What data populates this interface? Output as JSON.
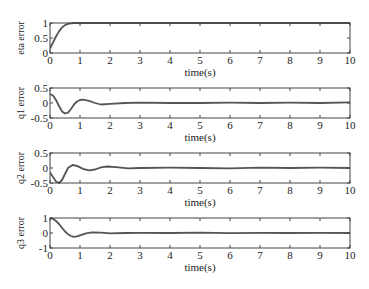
{
  "figure": {
    "width": 369,
    "height": 289
  },
  "style": {
    "line_color": "#555555",
    "axes_color": "#444444",
    "background": "#ffffff"
  },
  "chart_data": [
    {
      "type": "line",
      "title": "",
      "xlabel": "time(s)",
      "ylabel": "eta error",
      "xlim": [
        0,
        10
      ],
      "ylim": [
        0,
        1
      ],
      "xticks": [
        0,
        1,
        2,
        3,
        4,
        5,
        6,
        7,
        8,
        9,
        10
      ],
      "yticks": [
        0,
        0.5,
        1
      ],
      "ytick_labels": [
        "0",
        "0.5",
        "1"
      ],
      "grid": false,
      "box": {
        "left": 50,
        "top": 23,
        "right": 350,
        "bottom": 53
      },
      "series": [
        {
          "name": "eta error",
          "x": [
            0,
            0.1,
            0.2,
            0.3,
            0.4,
            0.5,
            0.6,
            0.7,
            0.8,
            1.0,
            2,
            4,
            6,
            8,
            10
          ],
          "y": [
            0.15,
            0.35,
            0.55,
            0.72,
            0.85,
            0.93,
            0.97,
            0.99,
            1.0,
            1.0,
            1.0,
            1.0,
            1.0,
            1.0,
            1.0
          ]
        }
      ]
    },
    {
      "type": "line",
      "title": "",
      "xlabel": "time(s)",
      "ylabel": "q1 error",
      "xlim": [
        0,
        10
      ],
      "ylim": [
        -0.5,
        0.5
      ],
      "xticks": [
        0,
        1,
        2,
        3,
        4,
        5,
        6,
        7,
        8,
        9,
        10
      ],
      "yticks": [
        -0.5,
        0,
        0.5
      ],
      "ytick_labels": [
        "-0.5",
        "0",
        "0.5"
      ],
      "grid": false,
      "box": {
        "left": 50,
        "top": 88,
        "right": 350,
        "bottom": 118
      },
      "series": [
        {
          "name": "q1 error",
          "x": [
            0,
            0.1,
            0.2,
            0.3,
            0.4,
            0.5,
            0.6,
            0.7,
            0.8,
            0.9,
            1.0,
            1.1,
            1.3,
            1.5,
            1.7,
            2.0,
            2.5,
            3,
            4,
            5,
            6,
            7,
            8,
            9,
            10
          ],
          "y": [
            0.3,
            0.25,
            0.1,
            -0.1,
            -0.28,
            -0.35,
            -0.32,
            -0.2,
            -0.05,
            0.05,
            0.1,
            0.11,
            0.07,
            0.0,
            -0.05,
            -0.03,
            0.0,
            0.01,
            0.0,
            0.0,
            0.01,
            0.0,
            0.01,
            0.0,
            0.02
          ]
        }
      ]
    },
    {
      "type": "line",
      "title": "",
      "xlabel": "time(s)",
      "ylabel": "q2 error",
      "xlim": [
        0,
        10
      ],
      "ylim": [
        -0.5,
        0.5
      ],
      "xticks": [
        0,
        1,
        2,
        3,
        4,
        5,
        6,
        7,
        8,
        9,
        10
      ],
      "yticks": [
        -0.5,
        0,
        0.5
      ],
      "ytick_labels": [
        "-0.5",
        "0",
        "0.5"
      ],
      "grid": false,
      "box": {
        "left": 50,
        "top": 153,
        "right": 350,
        "bottom": 183
      },
      "series": [
        {
          "name": "q2 error",
          "x": [
            0,
            0.1,
            0.2,
            0.3,
            0.4,
            0.5,
            0.6,
            0.75,
            0.9,
            1.1,
            1.3,
            1.5,
            1.7,
            1.9,
            2.2,
            2.6,
            3,
            4,
            5,
            6,
            7,
            8,
            9,
            10
          ],
          "y": [
            -0.15,
            -0.3,
            -0.45,
            -0.5,
            -0.4,
            -0.2,
            0.0,
            0.1,
            0.07,
            -0.03,
            -0.08,
            -0.05,
            0.02,
            0.05,
            0.03,
            -0.01,
            0.0,
            0.01,
            0.0,
            -0.01,
            0.01,
            0.0,
            0.01,
            0.0
          ]
        }
      ]
    },
    {
      "type": "line",
      "title": "",
      "xlabel": "time(s)",
      "ylabel": "q3 error",
      "xlim": [
        0,
        10
      ],
      "ylim": [
        -1,
        1
      ],
      "xticks": [
        0,
        1,
        2,
        3,
        4,
        5,
        6,
        7,
        8,
        9,
        10
      ],
      "yticks": [
        -1,
        0,
        1
      ],
      "ytick_labels": [
        "-1",
        "0",
        "1"
      ],
      "grid": false,
      "box": {
        "left": 50,
        "top": 218,
        "right": 350,
        "bottom": 248
      },
      "series": [
        {
          "name": "q3 error",
          "x": [
            0,
            0.1,
            0.2,
            0.3,
            0.4,
            0.5,
            0.6,
            0.7,
            0.8,
            0.9,
            1.0,
            1.2,
            1.4,
            1.7,
            2.0,
            2.5,
            3,
            4,
            5,
            6,
            7,
            8,
            9,
            10
          ],
          "y": [
            1.0,
            0.95,
            0.8,
            0.6,
            0.35,
            0.1,
            -0.08,
            -0.2,
            -0.25,
            -0.22,
            -0.15,
            -0.02,
            0.05,
            0.03,
            -0.02,
            0.0,
            0.01,
            0.0,
            0.02,
            -0.01,
            0.01,
            0.0,
            0.01,
            0.0
          ]
        }
      ]
    }
  ]
}
